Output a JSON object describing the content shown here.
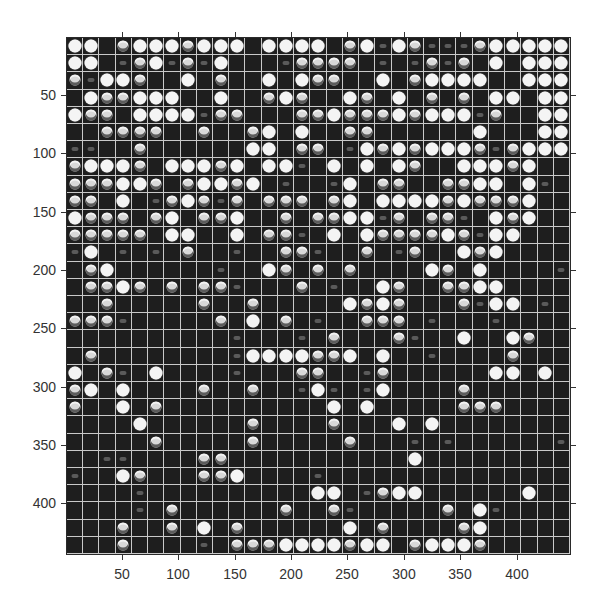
{
  "figure": {
    "type": "image-grid",
    "grid_rows": 30,
    "grid_cols": 31,
    "colors": {
      "background": "#1e1e1e",
      "gridline": "#c9c9c9",
      "spot_bright": "#f4f4f4",
      "spot_medium": "#d8d8d8",
      "spot_faint": "#5a5a5a",
      "axis": "#333333"
    },
    "intensity_legend": {
      "0": "empty",
      "1": "faint",
      "2": "medium",
      "3": "bright"
    }
  },
  "axes": {
    "x_ticks": [
      {
        "label": "50",
        "px": 122
      },
      {
        "label": "100",
        "px": 178
      },
      {
        "label": "150",
        "px": 235
      },
      {
        "label": "200",
        "px": 291
      },
      {
        "label": "250",
        "px": 347
      },
      {
        "label": "300",
        "px": 404
      },
      {
        "label": "350",
        "px": 460
      },
      {
        "label": "400",
        "px": 517
      }
    ],
    "y_ticks": [
      {
        "label": "50",
        "px": 95
      },
      {
        "label": "100",
        "px": 153
      },
      {
        "label": "150",
        "px": 212
      },
      {
        "label": "200",
        "px": 270
      },
      {
        "label": "250",
        "px": 328
      },
      {
        "label": "300",
        "px": 387
      },
      {
        "label": "350",
        "px": 445
      },
      {
        "label": "400",
        "px": 503
      }
    ],
    "xlim": [
      0,
      447
    ],
    "ylim": [
      0,
      444
    ]
  },
  "grid": [
    [
      3,
      3,
      0,
      2,
      3,
      3,
      3,
      2,
      3,
      3,
      3,
      0,
      3,
      3,
      3,
      3,
      0,
      2,
      3,
      1,
      3,
      2,
      1,
      1,
      1,
      2,
      3,
      3,
      3,
      3,
      3
    ],
    [
      3,
      3,
      0,
      1,
      2,
      3,
      1,
      2,
      1,
      3,
      0,
      0,
      0,
      1,
      2,
      2,
      2,
      2,
      0,
      1,
      0,
      1,
      2,
      1,
      2,
      0,
      3,
      0,
      3,
      3,
      3
    ],
    [
      2,
      1,
      3,
      3,
      2,
      0,
      0,
      3,
      0,
      2,
      0,
      0,
      3,
      0,
      3,
      2,
      2,
      0,
      0,
      3,
      0,
      2,
      3,
      3,
      3,
      3,
      0,
      0,
      3,
      3,
      3
    ],
    [
      0,
      3,
      2,
      2,
      3,
      3,
      3,
      0,
      0,
      3,
      0,
      0,
      2,
      3,
      2,
      0,
      0,
      3,
      2,
      0,
      3,
      0,
      2,
      0,
      2,
      0,
      3,
      3,
      0,
      3,
      3
    ],
    [
      3,
      2,
      2,
      0,
      3,
      3,
      3,
      3,
      1,
      2,
      2,
      0,
      0,
      0,
      2,
      2,
      3,
      2,
      2,
      2,
      3,
      2,
      3,
      3,
      3,
      1,
      2,
      0,
      0,
      3,
      3
    ],
    [
      0,
      0,
      2,
      2,
      2,
      2,
      0,
      0,
      2,
      0,
      0,
      2,
      3,
      0,
      3,
      0,
      0,
      2,
      2,
      0,
      0,
      0,
      0,
      0,
      0,
      3,
      0,
      0,
      0,
      3,
      3
    ],
    [
      1,
      1,
      0,
      0,
      2,
      0,
      0,
      0,
      0,
      0,
      0,
      3,
      3,
      0,
      2,
      2,
      0,
      1,
      3,
      2,
      3,
      2,
      3,
      3,
      3,
      2,
      1,
      2,
      3,
      3,
      3
    ],
    [
      2,
      3,
      3,
      3,
      2,
      0,
      3,
      3,
      3,
      2,
      3,
      0,
      3,
      3,
      1,
      0,
      3,
      0,
      3,
      0,
      3,
      2,
      0,
      0,
      3,
      3,
      3,
      2,
      3,
      0,
      0
    ],
    [
      2,
      2,
      2,
      3,
      3,
      2,
      0,
      2,
      3,
      3,
      2,
      3,
      0,
      1,
      0,
      0,
      1,
      3,
      0,
      2,
      2,
      0,
      0,
      2,
      2,
      3,
      3,
      0,
      3,
      1,
      0
    ],
    [
      2,
      2,
      0,
      3,
      0,
      1,
      2,
      3,
      2,
      1,
      2,
      0,
      2,
      2,
      2,
      0,
      2,
      3,
      0,
      3,
      3,
      3,
      3,
      2,
      3,
      2,
      2,
      2,
      3,
      0,
      0
    ],
    [
      3,
      2,
      2,
      2,
      0,
      2,
      3,
      0,
      2,
      2,
      3,
      0,
      0,
      2,
      0,
      2,
      2,
      3,
      3,
      1,
      2,
      0,
      2,
      2,
      1,
      0,
      3,
      2,
      3,
      0,
      0
    ],
    [
      2,
      2,
      2,
      2,
      2,
      0,
      3,
      3,
      0,
      0,
      3,
      0,
      2,
      2,
      1,
      0,
      3,
      0,
      3,
      2,
      2,
      2,
      2,
      3,
      2,
      1,
      3,
      3,
      0,
      0,
      0
    ],
    [
      1,
      3,
      0,
      1,
      0,
      1,
      0,
      2,
      0,
      0,
      1,
      0,
      0,
      2,
      2,
      1,
      0,
      0,
      2,
      0,
      1,
      2,
      0,
      0,
      3,
      2,
      3,
      0,
      0,
      0,
      0
    ],
    [
      0,
      2,
      3,
      0,
      0,
      0,
      0,
      0,
      0,
      1,
      0,
      0,
      3,
      2,
      0,
      2,
      0,
      2,
      0,
      0,
      0,
      0,
      3,
      2,
      0,
      3,
      0,
      0,
      0,
      0,
      1
    ],
    [
      0,
      2,
      2,
      3,
      2,
      0,
      2,
      0,
      2,
      2,
      1,
      0,
      0,
      0,
      2,
      0,
      1,
      0,
      0,
      3,
      2,
      0,
      0,
      2,
      2,
      3,
      3,
      0,
      0,
      0,
      0
    ],
    [
      0,
      0,
      2,
      0,
      0,
      0,
      0,
      0,
      2,
      0,
      0,
      2,
      0,
      0,
      0,
      0,
      0,
      3,
      2,
      3,
      2,
      0,
      0,
      0,
      2,
      1,
      3,
      3,
      0,
      1,
      0
    ],
    [
      2,
      2,
      2,
      1,
      0,
      0,
      0,
      0,
      0,
      2,
      0,
      3,
      0,
      2,
      0,
      1,
      0,
      0,
      2,
      2,
      2,
      0,
      1,
      0,
      0,
      0,
      1,
      0,
      0,
      0,
      0
    ],
    [
      0,
      0,
      0,
      0,
      0,
      0,
      0,
      0,
      0,
      0,
      1,
      0,
      0,
      0,
      1,
      0,
      2,
      0,
      0,
      0,
      2,
      1,
      0,
      0,
      3,
      0,
      0,
      3,
      2,
      0,
      0
    ],
    [
      0,
      2,
      0,
      0,
      0,
      0,
      0,
      0,
      0,
      0,
      1,
      3,
      3,
      3,
      3,
      2,
      2,
      3,
      0,
      3,
      0,
      0,
      1,
      0,
      0,
      0,
      0,
      2,
      0,
      0,
      0
    ],
    [
      3,
      0,
      2,
      1,
      0,
      3,
      0,
      0,
      0,
      0,
      1,
      0,
      0,
      0,
      2,
      2,
      0,
      0,
      1,
      2,
      0,
      0,
      0,
      0,
      0,
      0,
      3,
      3,
      0,
      3,
      0
    ],
    [
      2,
      3,
      0,
      3,
      0,
      0,
      0,
      0,
      2,
      0,
      0,
      2,
      0,
      0,
      1,
      3,
      1,
      0,
      1,
      3,
      0,
      0,
      0,
      0,
      2,
      0,
      0,
      0,
      0,
      0,
      0
    ],
    [
      2,
      0,
      0,
      3,
      0,
      2,
      0,
      0,
      0,
      0,
      0,
      0,
      0,
      0,
      0,
      0,
      3,
      0,
      3,
      0,
      0,
      0,
      0,
      0,
      2,
      2,
      2,
      0,
      0,
      0,
      0
    ],
    [
      0,
      0,
      0,
      0,
      3,
      0,
      0,
      0,
      0,
      0,
      0,
      2,
      0,
      0,
      0,
      0,
      2,
      0,
      0,
      0,
      3,
      0,
      3,
      0,
      0,
      0,
      0,
      0,
      0,
      0,
      0
    ],
    [
      0,
      0,
      0,
      0,
      0,
      2,
      0,
      0,
      0,
      0,
      0,
      2,
      0,
      0,
      0,
      0,
      0,
      2,
      0,
      0,
      0,
      1,
      0,
      1,
      0,
      0,
      0,
      0,
      0,
      0,
      1
    ],
    [
      0,
      0,
      1,
      1,
      0,
      0,
      0,
      0,
      2,
      2,
      0,
      0,
      0,
      0,
      0,
      0,
      0,
      0,
      0,
      0,
      0,
      3,
      0,
      0,
      0,
      0,
      0,
      0,
      0,
      0,
      0
    ],
    [
      1,
      0,
      0,
      3,
      2,
      0,
      0,
      0,
      2,
      2,
      3,
      0,
      0,
      0,
      0,
      1,
      0,
      0,
      0,
      0,
      0,
      0,
      0,
      0,
      0,
      0,
      0,
      0,
      0,
      0,
      0
    ],
    [
      0,
      0,
      0,
      0,
      1,
      0,
      0,
      0,
      0,
      0,
      0,
      0,
      0,
      0,
      0,
      3,
      3,
      0,
      1,
      2,
      3,
      3,
      0,
      0,
      0,
      0,
      0,
      0,
      3,
      0,
      0
    ],
    [
      0,
      0,
      0,
      0,
      1,
      0,
      2,
      0,
      0,
      0,
      0,
      0,
      0,
      2,
      0,
      0,
      2,
      1,
      0,
      0,
      0,
      0,
      0,
      2,
      0,
      3,
      1,
      0,
      0,
      0,
      0
    ],
    [
      0,
      0,
      0,
      2,
      0,
      0,
      2,
      0,
      3,
      0,
      2,
      0,
      0,
      0,
      0,
      0,
      0,
      3,
      0,
      2,
      0,
      0,
      0,
      0,
      2,
      3,
      0,
      0,
      0,
      0,
      0
    ],
    [
      0,
      0,
      0,
      2,
      0,
      0,
      0,
      0,
      1,
      0,
      2,
      2,
      2,
      3,
      3,
      3,
      3,
      2,
      3,
      3,
      0,
      2,
      3,
      3,
      3,
      2,
      0,
      0,
      0,
      0,
      0
    ]
  ]
}
